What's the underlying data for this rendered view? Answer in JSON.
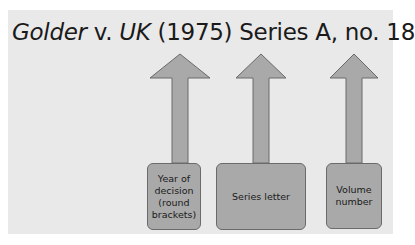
{
  "title": {
    "party1": "Golder",
    "versus": " v. ",
    "party2": "UK",
    "rest": " (1975) Series A, no. 18"
  },
  "boxes": [
    {
      "label": "Year of decision (round brackets)"
    },
    {
      "label": "Series letter"
    },
    {
      "label": "Volume number"
    }
  ],
  "colors": {
    "panel": "#e9e9e9",
    "shape_fill": "#a9a9a9",
    "shape_stroke": "#6a6a6a"
  }
}
